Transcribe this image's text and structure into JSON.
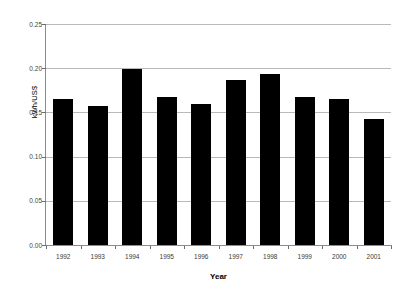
{
  "chart_data": {
    "type": "bar",
    "title": "",
    "subtitle": "",
    "xlabel": "Year",
    "ylabel": "kWh/US$",
    "categories": [
      "1992",
      "1993",
      "1994",
      "1995",
      "1996",
      "1997",
      "1998",
      "1999",
      "2000",
      "2001"
    ],
    "values": [
      0.165,
      0.157,
      0.199,
      0.168,
      0.16,
      0.187,
      0.193,
      0.168,
      0.165,
      0.143
    ],
    "series": [
      {
        "name": "kWh/US$",
        "values": [
          0.165,
          0.157,
          0.199,
          0.168,
          0.16,
          0.187,
          0.193,
          0.168,
          0.165,
          0.143
        ]
      }
    ],
    "ylim": [
      0.0,
      0.25
    ],
    "ytick_labels": [
      "0.25",
      "0.20",
      "0.15",
      "0.10",
      "0.05",
      "0.00"
    ],
    "ytick_values": [
      0.25,
      0.2,
      0.15,
      0.1,
      0.05,
      0.0
    ],
    "ytick_interval": 0.05,
    "grid": "horizontal",
    "legend": "none",
    "bar_color": "#000000",
    "gridline_color": "#b9b9b9",
    "axis_color": "#8c8c8c",
    "background_color": "#ffffff",
    "annotations": []
  }
}
